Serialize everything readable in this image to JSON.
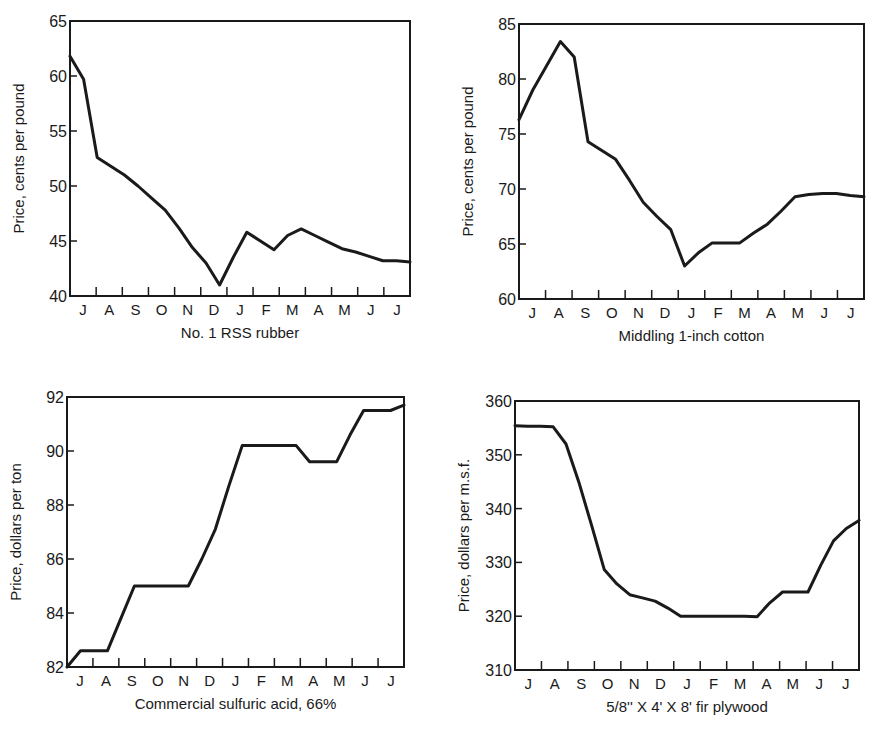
{
  "chart_data": [
    {
      "type": "line",
      "title": "No. 1 RSS rubber",
      "xlabel": "No. 1 RSS rubber",
      "ylabel": "Price, cents per pound",
      "ylim": [
        40,
        65
      ],
      "yticks": [
        40,
        45,
        50,
        55,
        60,
        65
      ],
      "categories": [
        "J",
        "A",
        "S",
        "O",
        "N",
        "D",
        "J",
        "F",
        "M",
        "A",
        "M",
        "J",
        "J"
      ],
      "grid": false,
      "x": [
        0,
        0.3,
        1,
        1.5,
        2,
        2.5,
        3,
        3.5,
        4,
        4.5,
        5,
        5.5,
        6,
        6.5,
        7,
        7.5,
        8,
        8.5,
        9,
        9.5,
        10,
        10.5,
        11,
        11.5,
        12,
        12.5
      ],
      "values": [
        61.8,
        59.7,
        52.6,
        51.8,
        51.0,
        50.0,
        48.9,
        47.8,
        46.2,
        44.4,
        43.0,
        41.0,
        43.5,
        45.8,
        45.0,
        44.2,
        45.5,
        46.1,
        45.5,
        44.9,
        44.3,
        44.0,
        43.6,
        43.2,
        43.2,
        43.1
      ]
    },
    {
      "type": "line",
      "title": "Middling 1-inch cotton",
      "xlabel": "Middling 1-inch cotton",
      "ylabel": "Price, cents per pound",
      "ylim": [
        60,
        85
      ],
      "yticks": [
        60,
        65,
        70,
        75,
        80,
        85
      ],
      "categories": [
        "J",
        "A",
        "S",
        "O",
        "N",
        "D",
        "J",
        "F",
        "M",
        "A",
        "M",
        "J",
        "J"
      ],
      "grid": false,
      "x": [
        0,
        0.5,
        1,
        1.5,
        2,
        2.5,
        3,
        3.5,
        4,
        4.5,
        5,
        5.5,
        6,
        6.5,
        7,
        7.5,
        8,
        8.5,
        9,
        9.5,
        10,
        10.5,
        11,
        11.5,
        12,
        12.5
      ],
      "values": [
        76.3,
        79.0,
        81.2,
        83.4,
        82.0,
        74.3,
        73.5,
        72.7,
        70.8,
        68.8,
        67.5,
        66.3,
        63.0,
        64.2,
        65.1,
        65.1,
        65.1,
        66.0,
        66.8,
        68.0,
        69.3,
        69.5,
        69.6,
        69.6,
        69.4,
        69.3
      ]
    },
    {
      "type": "line",
      "title": "Commercial sulfuric acid, 66%",
      "xlabel": "Commercial sulfuric acid, 66%",
      "ylabel": "Price, dollars per ton",
      "ylim": [
        82,
        92
      ],
      "yticks": [
        82,
        84,
        86,
        88,
        90,
        92
      ],
      "categories": [
        "J",
        "A",
        "S",
        "O",
        "N",
        "D",
        "J",
        "F",
        "M",
        "A",
        "M",
        "J",
        "J"
      ],
      "grid": false,
      "x": [
        0,
        0.5,
        1,
        1.5,
        2,
        2.5,
        3,
        3.5,
        4,
        4.5,
        5,
        5.5,
        6,
        6.5,
        7,
        7.5,
        8,
        8.5,
        9,
        9.5,
        10,
        10.5,
        11,
        11.5,
        12,
        12.5
      ],
      "values": [
        82.0,
        82.6,
        82.6,
        82.6,
        83.8,
        85.0,
        85.0,
        85.0,
        85.0,
        85.0,
        86.0,
        87.1,
        88.7,
        90.2,
        90.2,
        90.2,
        90.2,
        90.2,
        89.6,
        89.6,
        89.6,
        90.6,
        91.5,
        91.5,
        91.5,
        91.7
      ]
    },
    {
      "type": "line",
      "title": "5/8'' X 4' X 8' fir plywood",
      "xlabel": "5/8'' X 4' X 8' fir plywood",
      "ylabel": "Price, dollars per m.s.f.",
      "ylim": [
        310,
        360
      ],
      "yticks": [
        310,
        320,
        330,
        340,
        350,
        360
      ],
      "categories": [
        "J",
        "A",
        "S",
        "O",
        "N",
        "D",
        "J",
        "F",
        "M",
        "A",
        "M",
        "J",
        "J"
      ],
      "grid": false,
      "x": [
        0,
        0.5,
        1,
        1.5,
        2,
        2.5,
        3,
        3.5,
        4,
        4.5,
        5,
        5.5,
        6,
        6.5,
        7,
        7.5,
        8,
        8.5,
        9,
        9.5,
        10,
        10.5,
        11,
        11.5,
        12,
        12.5
      ],
      "values": [
        355.4,
        355.3,
        355.3,
        355.2,
        352.0,
        345.0,
        337.0,
        328.7,
        326.0,
        324.0,
        323.4,
        322.8,
        321.5,
        320.0,
        320.0,
        320.0,
        320.0,
        320.0,
        320.0,
        319.9,
        322.5,
        324.5,
        324.5,
        324.5,
        329.5,
        334.0,
        336.3,
        337.8
      ]
    }
  ],
  "charts": [
    {
      "title": "No. 1 RSS rubber",
      "ylabel": "Price, cents per pound"
    },
    {
      "title": "Middling 1-inch cotton",
      "ylabel": "Price, cents per pound"
    },
    {
      "title": "Commercial sulfuric acid, 66%",
      "ylabel": "Price, dollars per ton"
    },
    {
      "title": "5/8'' X 4' X 8' fir plywood",
      "ylabel": "Price, dollars per m.s.f."
    }
  ]
}
